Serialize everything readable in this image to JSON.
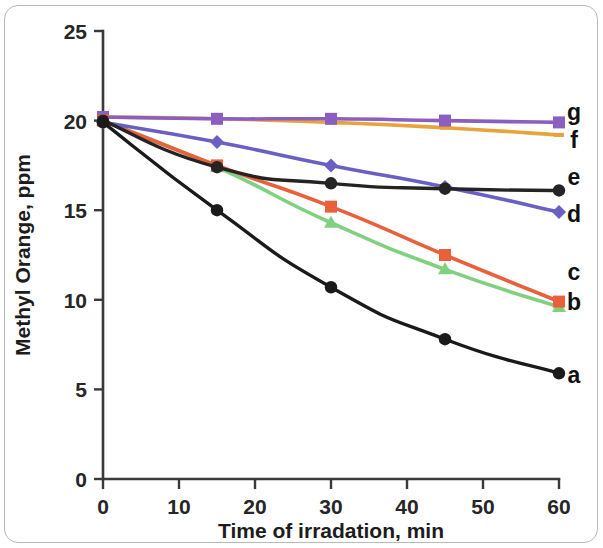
{
  "figure": {
    "frame_color": "#b9b9b9",
    "background": "#ffffff"
  },
  "chart_data": {
    "type": "line",
    "title": "",
    "xlabel": "Time of irradation, min",
    "ylabel": "Methyl Orange, ppm",
    "x": [
      0,
      15,
      30,
      45,
      60
    ],
    "xlim": [
      0,
      60
    ],
    "ylim": [
      0,
      25
    ],
    "xticks": [
      0,
      10,
      20,
      30,
      40,
      50,
      60
    ],
    "yticks": [
      0,
      5,
      10,
      15,
      20,
      25
    ],
    "xticklabels": [
      "0",
      "10",
      "20",
      "30",
      "40",
      "50",
      "60"
    ],
    "yticklabels": [
      "0",
      "5",
      "10",
      "15",
      "20",
      "25"
    ],
    "grid": false,
    "legend": "inline-right-labels",
    "series": [
      {
        "name": "a",
        "label": "a",
        "color": "#1a1a1a",
        "marker": "circle",
        "values": [
          19.9,
          15.0,
          10.7,
          7.8,
          5.9
        ]
      },
      {
        "name": "b",
        "label": "b",
        "color": "#80d080",
        "marker": "triangle",
        "values": [
          20.0,
          17.4,
          14.3,
          11.7,
          9.6
        ]
      },
      {
        "name": "c",
        "label": "c",
        "color": "#e8603c",
        "marker": "square",
        "values": [
          20.0,
          17.5,
          15.2,
          12.5,
          9.9
        ]
      },
      {
        "name": "d",
        "label": "d",
        "color": "#6a5fc4",
        "marker": "diamond",
        "values": [
          19.9,
          18.8,
          17.5,
          16.3,
          14.9
        ]
      },
      {
        "name": "e",
        "label": "e",
        "color": "#242424",
        "marker": "circle",
        "values": [
          20.0,
          17.4,
          16.5,
          16.2,
          16.1
        ]
      },
      {
        "name": "f",
        "label": "f",
        "color": "#e8a33d",
        "marker": "line",
        "values": [
          20.2,
          20.1,
          19.9,
          19.6,
          19.2
        ]
      },
      {
        "name": "g",
        "label": "g",
        "color": "#8a5fbf",
        "marker": "square",
        "values": [
          20.2,
          20.1,
          20.1,
          20.0,
          19.9
        ]
      }
    ]
  }
}
